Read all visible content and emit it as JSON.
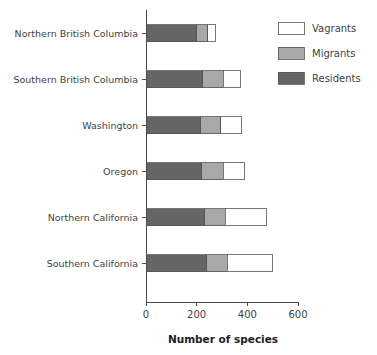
{
  "chart_data": {
    "type": "bar",
    "orientation": "horizontal",
    "stacked": true,
    "title": "",
    "xlabel": "Number of species",
    "ylabel": "",
    "xlim": [
      0,
      600
    ],
    "xticks": [
      0,
      200,
      400,
      600
    ],
    "xtick_labels": [
      "0",
      "200",
      "400",
      "600"
    ],
    "grid": false,
    "legend_position": "top-right",
    "categories": [
      "Northern British Columbia",
      "Southern British Columbia",
      "Washington",
      "Oregon",
      "Northern California",
      "Southern California"
    ],
    "series": [
      {
        "name": "Residents",
        "color": "#656565",
        "values": [
          200,
          224,
          216,
          220,
          232,
          240
        ]
      },
      {
        "name": "Migrants",
        "color": "#a8a8a8",
        "values": [
          44,
          80,
          80,
          84,
          80,
          80
        ]
      },
      {
        "name": "Vagrants",
        "color": "#ffffff",
        "values": [
          32,
          68,
          80,
          84,
          164,
          180
        ]
      }
    ],
    "totals": [
      276,
      372,
      376,
      388,
      476,
      500
    ],
    "legend_order": [
      "Vagrants",
      "Migrants",
      "Residents"
    ]
  },
  "legend": {
    "items": [
      {
        "label": "Vagrants",
        "color": "#ffffff"
      },
      {
        "label": "Migrants",
        "color": "#a8a8a8"
      },
      {
        "label": "Residents",
        "color": "#656565"
      }
    ]
  },
  "axis": {
    "x_title": "Number of species",
    "x_tick_labels": [
      "0",
      "200",
      "400",
      "600"
    ]
  },
  "category_labels": [
    "Northern British Columbia",
    "Southern British Columbia",
    "Washington",
    "Oregon",
    "Northern California",
    "Southern California"
  ]
}
